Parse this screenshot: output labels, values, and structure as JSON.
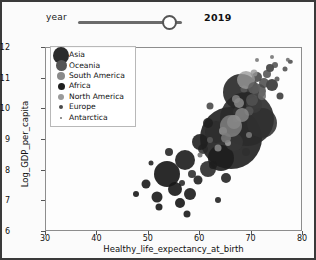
{
  "controls": {
    "slider": {
      "label": "year",
      "value": "2019",
      "min": 2005,
      "max": 2021,
      "fill_percent": 88
    }
  },
  "chart_data": {
    "type": "scatter",
    "title": "",
    "xlabel": "Healthy_life_expectancy_at_birth",
    "ylabel": "Log_GDP_per_capita",
    "xlim": [
      30,
      80
    ],
    "ylim": [
      6,
      12
    ],
    "xticks": [
      30,
      40,
      50,
      60,
      70,
      80
    ],
    "yticks": [
      6,
      7,
      8,
      9,
      10,
      11,
      12
    ],
    "grid": false,
    "legend_position": "upper-left",
    "legend_title": "",
    "size_encoding": "population",
    "series": [
      {
        "name": "Asia",
        "color": "#2b2b2b",
        "legend_marker_px": 17
      },
      {
        "name": "Oceania",
        "color": "#555555",
        "legend_marker_px": 11
      },
      {
        "name": "South America",
        "color": "#8a8a8a",
        "legend_marker_px": 8
      },
      {
        "name": "Africa",
        "color": "#1f1f1f",
        "legend_marker_px": 7
      },
      {
        "name": "North America",
        "color": "#9a9a9a",
        "legend_marker_px": 6
      },
      {
        "name": "Europe",
        "color": "#4a4a4a",
        "legend_marker_px": 4
      },
      {
        "name": "Antarctica",
        "color": "#707070",
        "legend_marker_px": 2
      }
    ],
    "points": [
      {
        "s": "Asia",
        "x": 66.0,
        "y": 9.05,
        "r": 31,
        "c": "#232323",
        "o": 0.92
      },
      {
        "s": "Asia",
        "x": 69.2,
        "y": 9.7,
        "r": 27,
        "c": "#2a2a2a",
        "o": 0.9
      },
      {
        "s": "Asia",
        "x": 68.0,
        "y": 10.55,
        "r": 18,
        "c": "#262626",
        "o": 0.9
      },
      {
        "s": "Asia",
        "x": 72.0,
        "y": 9.55,
        "r": 15,
        "c": "#303030",
        "o": 0.88
      },
      {
        "s": "Asia",
        "x": 64.0,
        "y": 8.4,
        "r": 13,
        "c": "#1d1d1d",
        "o": 0.9
      },
      {
        "s": "Asia",
        "x": 63.0,
        "y": 9.25,
        "r": 11,
        "c": "#2e2e2e",
        "o": 0.88
      },
      {
        "s": "Asia",
        "x": 66.5,
        "y": 8.95,
        "r": 9,
        "c": "#373737",
        "o": 0.86
      },
      {
        "s": "Asia",
        "x": 61.5,
        "y": 8.05,
        "r": 8,
        "c": "#242424",
        "o": 0.88
      },
      {
        "s": "Asia",
        "x": 70.5,
        "y": 10.15,
        "r": 8,
        "c": "#3a3a3a",
        "o": 0.86
      },
      {
        "s": "Asia",
        "x": 74.0,
        "y": 10.8,
        "r": 6,
        "c": "#2b2b2b",
        "o": 0.86
      },
      {
        "s": "Asia",
        "x": 67.5,
        "y": 9.9,
        "r": 6,
        "c": "#333333",
        "o": 0.85
      },
      {
        "s": "Asia",
        "x": 60.5,
        "y": 8.7,
        "r": 5,
        "c": "#2a2a2a",
        "o": 0.86
      },
      {
        "s": "Asia",
        "x": 71.0,
        "y": 11.05,
        "r": 5,
        "c": "#3d3d3d",
        "o": 0.85
      },
      {
        "s": "Asia",
        "x": 65.0,
        "y": 7.75,
        "r": 5,
        "c": "#1e1e1e",
        "o": 0.88
      },
      {
        "s": "Asia",
        "x": 58.5,
        "y": 7.9,
        "r": 4,
        "c": "#262626",
        "o": 0.86
      },
      {
        "s": "Asia",
        "x": 73.5,
        "y": 11.35,
        "r": 4,
        "c": "#343434",
        "o": 0.85
      },
      {
        "s": "Asia",
        "x": 69.0,
        "y": 8.6,
        "r": 4,
        "c": "#2f2f2f",
        "o": 0.85
      },
      {
        "s": "Asia",
        "x": 75.5,
        "y": 10.45,
        "r": 3.5,
        "c": "#303030",
        "o": 0.85
      },
      {
        "s": "Asia",
        "x": 62.0,
        "y": 10.1,
        "r": 3.5,
        "c": "#3b3b3b",
        "o": 0.84
      },
      {
        "s": "Asia",
        "x": 56.5,
        "y": 7.6,
        "r": 3,
        "c": "#222222",
        "o": 0.86
      },
      {
        "s": "Africa",
        "x": 53.5,
        "y": 7.9,
        "r": 13,
        "c": "#191919",
        "o": 0.92
      },
      {
        "s": "Africa",
        "x": 57.0,
        "y": 8.35,
        "r": 10,
        "c": "#1c1c1c",
        "o": 0.9
      },
      {
        "s": "Africa",
        "x": 60.0,
        "y": 8.95,
        "r": 8,
        "c": "#1f1f1f",
        "o": 0.9
      },
      {
        "s": "Africa",
        "x": 55.0,
        "y": 7.4,
        "r": 7,
        "c": "#171717",
        "o": 0.9
      },
      {
        "s": "Africa",
        "x": 58.0,
        "y": 7.25,
        "r": 6,
        "c": "#1b1b1b",
        "o": 0.9
      },
      {
        "s": "Africa",
        "x": 51.5,
        "y": 7.15,
        "r": 5.5,
        "c": "#181818",
        "o": 0.9
      },
      {
        "s": "Africa",
        "x": 61.5,
        "y": 9.55,
        "r": 5,
        "c": "#202020",
        "o": 0.88
      },
      {
        "s": "Africa",
        "x": 56.0,
        "y": 6.95,
        "r": 5,
        "c": "#151515",
        "o": 0.9
      },
      {
        "s": "Africa",
        "x": 59.5,
        "y": 7.7,
        "r": 4.5,
        "c": "#1d1d1d",
        "o": 0.89
      },
      {
        "s": "Africa",
        "x": 49.5,
        "y": 7.55,
        "r": 4.5,
        "c": "#1a1a1a",
        "o": 0.9
      },
      {
        "s": "Africa",
        "x": 54.0,
        "y": 8.6,
        "r": 4,
        "c": "#212121",
        "o": 0.88
      },
      {
        "s": "Africa",
        "x": 62.5,
        "y": 8.2,
        "r": 4,
        "c": "#1e1e1e",
        "o": 0.88
      },
      {
        "s": "Africa",
        "x": 52.0,
        "y": 6.8,
        "r": 3.5,
        "c": "#161616",
        "o": 0.9
      },
      {
        "s": "Africa",
        "x": 57.5,
        "y": 6.6,
        "r": 3.5,
        "c": "#191919",
        "o": 0.9
      },
      {
        "s": "Africa",
        "x": 63.5,
        "y": 7.05,
        "r": 3,
        "c": "#1c1c1c",
        "o": 0.88
      },
      {
        "s": "Africa",
        "x": 47.5,
        "y": 7.25,
        "r": 3,
        "c": "#181818",
        "o": 0.9
      },
      {
        "s": "Africa",
        "x": 64.5,
        "y": 9.15,
        "r": 3,
        "c": "#232323",
        "o": 0.88
      },
      {
        "s": "Africa",
        "x": 50.5,
        "y": 8.25,
        "r": 2.5,
        "c": "#1f1f1f",
        "o": 0.88
      },
      {
        "s": "Europe",
        "x": 71.5,
        "y": 10.6,
        "r": 7,
        "c": "#4a4a4a",
        "o": 0.86
      },
      {
        "s": "Europe",
        "x": 70.0,
        "y": 10.3,
        "r": 6,
        "c": "#525252",
        "o": 0.85
      },
      {
        "s": "Europe",
        "x": 72.5,
        "y": 10.85,
        "r": 5,
        "c": "#474747",
        "o": 0.85
      },
      {
        "s": "Europe",
        "x": 69.5,
        "y": 9.95,
        "r": 4.5,
        "c": "#555555",
        "o": 0.84
      },
      {
        "s": "Europe",
        "x": 73.0,
        "y": 11.15,
        "r": 4,
        "c": "#4e4e4e",
        "o": 0.85
      },
      {
        "s": "Europe",
        "x": 68.5,
        "y": 10.65,
        "r": 3.5,
        "c": "#5a5a5a",
        "o": 0.84
      },
      {
        "s": "Europe",
        "x": 74.5,
        "y": 11.45,
        "r": 3,
        "c": "#4c4c4c",
        "o": 0.85
      },
      {
        "s": "Europe",
        "x": 67.0,
        "y": 9.7,
        "r": 3,
        "c": "#585858",
        "o": 0.84
      },
      {
        "s": "Europe",
        "x": 75.0,
        "y": 11.0,
        "r": 2.5,
        "c": "#505050",
        "o": 0.85
      },
      {
        "s": "Europe",
        "x": 76.5,
        "y": 11.3,
        "r": 2.5,
        "c": "#4a4a4a",
        "o": 0.85
      },
      {
        "s": "Europe",
        "x": 77.5,
        "y": 11.55,
        "r": 2.2,
        "c": "#464646",
        "o": 0.85
      },
      {
        "s": "North America",
        "x": 69.0,
        "y": 10.95,
        "r": 9,
        "c": "#9a9a9a",
        "o": 0.8
      },
      {
        "s": "North America",
        "x": 66.5,
        "y": 9.6,
        "r": 7,
        "c": "#a3a3a3",
        "o": 0.78
      },
      {
        "s": "North America",
        "x": 67.5,
        "y": 10.2,
        "r": 5,
        "c": "#909090",
        "o": 0.8
      },
      {
        "s": "North America",
        "x": 64.5,
        "y": 9.3,
        "r": 4,
        "c": "#9e9e9e",
        "o": 0.78
      },
      {
        "s": "North America",
        "x": 70.5,
        "y": 11.2,
        "r": 3.5,
        "c": "#959595",
        "o": 0.8
      },
      {
        "s": "North America",
        "x": 65.5,
        "y": 8.9,
        "r": 3,
        "c": "#a8a8a8",
        "o": 0.78
      },
      {
        "s": "South America",
        "x": 66.0,
        "y": 9.45,
        "r": 11,
        "c": "#848484",
        "o": 0.82
      },
      {
        "s": "South America",
        "x": 68.2,
        "y": 9.8,
        "r": 7,
        "c": "#8c8c8c",
        "o": 0.8
      },
      {
        "s": "South America",
        "x": 65.0,
        "y": 9.05,
        "r": 5,
        "c": "#7d7d7d",
        "o": 0.82
      },
      {
        "s": "South America",
        "x": 67.0,
        "y": 10.35,
        "r": 4,
        "c": "#888888",
        "o": 0.8
      },
      {
        "s": "South America",
        "x": 63.5,
        "y": 8.75,
        "r": 3.5,
        "c": "#919191",
        "o": 0.8
      },
      {
        "s": "South America",
        "x": 69.5,
        "y": 9.15,
        "r": 3,
        "c": "#7f7f7f",
        "o": 0.82
      },
      {
        "s": "Oceania",
        "x": 70.5,
        "y": 10.7,
        "r": 6,
        "c": "#5e5e5e",
        "o": 0.84
      },
      {
        "s": "Oceania",
        "x": 72.0,
        "y": 10.45,
        "r": 4,
        "c": "#666666",
        "o": 0.82
      },
      {
        "s": "Oceania",
        "x": 62.0,
        "y": 9.0,
        "r": 3,
        "c": "#5a5a5a",
        "o": 0.84
      },
      {
        "s": "Oceania",
        "x": 60.0,
        "y": 8.5,
        "r": 2.5,
        "c": "#626262",
        "o": 0.82
      },
      {
        "s": "Antarctica",
        "x": 74.0,
        "y": 11.7,
        "r": 2,
        "c": "#6e6e6e",
        "o": 0.85
      },
      {
        "s": "Antarctica",
        "x": 71.0,
        "y": 11.6,
        "r": 2,
        "c": "#737373",
        "o": 0.85
      },
      {
        "s": "Antarctica",
        "x": 77.0,
        "y": 11.62,
        "r": 2.2,
        "c": "#6a6a6a",
        "o": 0.85
      }
    ]
  }
}
